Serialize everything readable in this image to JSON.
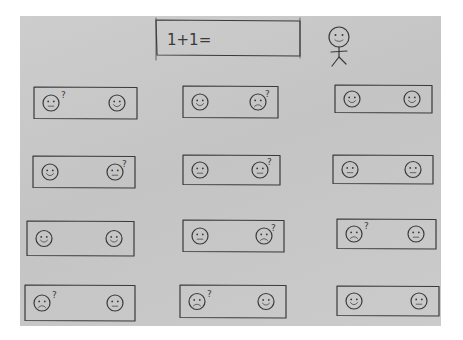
{
  "question": {
    "text": "1+1="
  },
  "avatar": {
    "icon": "stick-figure-icon",
    "expression": "happy"
  },
  "cards": [
    {
      "row": 1,
      "col": 1,
      "left_face": "confused",
      "right_face": "happy",
      "question_mark_on": "left"
    },
    {
      "row": 1,
      "col": 2,
      "left_face": "happy",
      "right_face": "sad",
      "question_mark_on": "right"
    },
    {
      "row": 1,
      "col": 3,
      "left_face": "happy",
      "right_face": "happy",
      "question_mark_on": "none"
    },
    {
      "row": 2,
      "col": 1,
      "left_face": "happy",
      "right_face": "confused",
      "question_mark_on": "right"
    },
    {
      "row": 2,
      "col": 2,
      "left_face": "confused",
      "right_face": "confused",
      "question_mark_on": "right"
    },
    {
      "row": 2,
      "col": 3,
      "left_face": "confused",
      "right_face": "confused",
      "question_mark_on": "none"
    },
    {
      "row": 3,
      "col": 1,
      "left_face": "happy",
      "right_face": "happy",
      "question_mark_on": "none"
    },
    {
      "row": 3,
      "col": 2,
      "left_face": "confused",
      "right_face": "sad",
      "question_mark_on": "right"
    },
    {
      "row": 3,
      "col": 3,
      "left_face": "sad",
      "right_face": "confused",
      "question_mark_on": "left"
    },
    {
      "row": 4,
      "col": 1,
      "left_face": "sad",
      "right_face": "confused",
      "question_mark_on": "left"
    },
    {
      "row": 4,
      "col": 2,
      "left_face": "sad",
      "right_face": "happy",
      "question_mark_on": "left"
    },
    {
      "row": 4,
      "col": 3,
      "left_face": "happy",
      "right_face": "confused",
      "question_mark_on": "none"
    }
  ],
  "glyphs": {
    "question_mark": "?"
  }
}
